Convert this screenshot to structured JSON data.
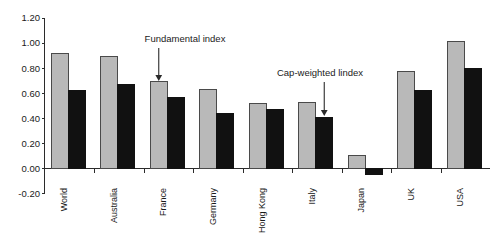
{
  "chart_data": {
    "type": "bar",
    "title": "",
    "subtitle": "",
    "xlabel": "",
    "ylabel": "",
    "categories": [
      "World",
      "Australia",
      "France",
      "Germany",
      "Hong Kong",
      "Italy",
      "Japan",
      "UK",
      "USA"
    ],
    "series": [
      {
        "name": "Fundamental index",
        "color": "#b9b9b9",
        "values": [
          0.92,
          0.89,
          0.69,
          0.63,
          0.52,
          0.53,
          0.1,
          0.77,
          1.01
        ]
      },
      {
        "name": "Cap-weighted lindex",
        "color": "#111111",
        "values": [
          0.62,
          0.67,
          0.57,
          0.44,
          0.47,
          0.41,
          -0.05,
          0.62,
          0.8
        ]
      }
    ],
    "ylim": [
      -0.2,
      1.2
    ],
    "ytick_step": 0.2,
    "ytick_labels": [
      "1.20",
      "1.00",
      "0.80",
      "0.60",
      "0.40",
      "0.20",
      "0.00",
      "-0.20"
    ],
    "ytick_values": [
      1.2,
      1.0,
      0.8,
      0.6,
      0.4,
      0.2,
      0.0,
      -0.2
    ],
    "grid": false,
    "legend": "none",
    "annotations": [
      {
        "text": "Fundamental index",
        "target_category": "France",
        "target_series": "Fundamental index"
      },
      {
        "text": "Cap-weighted lindex",
        "target_category": "Italy",
        "target_series": "Cap-weighted lindex"
      }
    ]
  }
}
